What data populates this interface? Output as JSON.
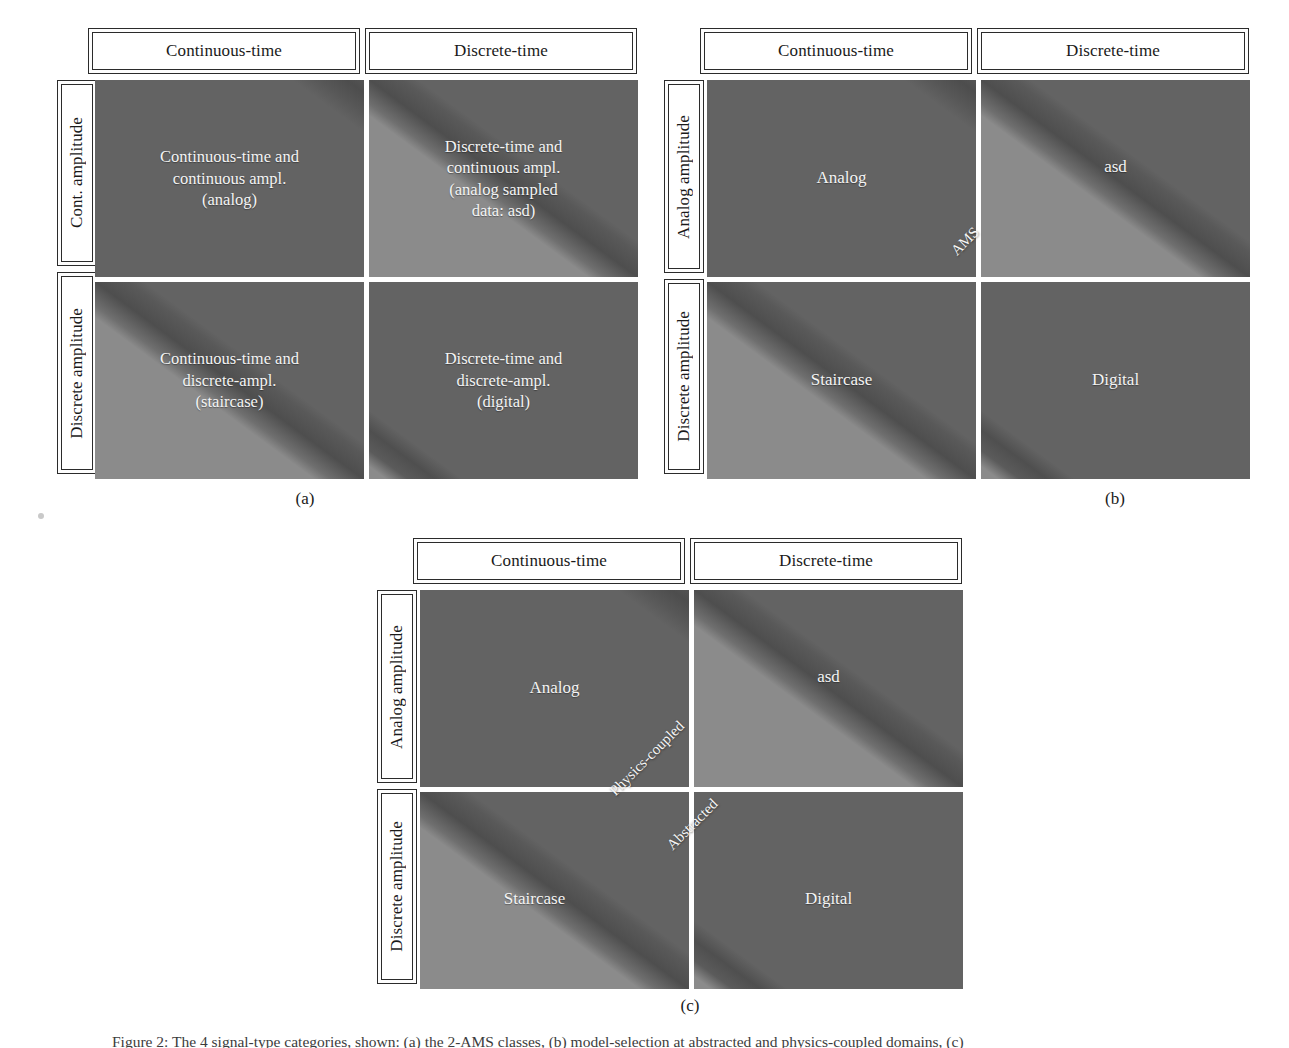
{
  "figure": {
    "caption": "Figure 2: The 4 signal-type categories, shown: (a) the 2-AMS classes, (b) model-selection at abstracted and physics-coupled domains, (c)"
  },
  "columns": {
    "continuous_time": "Continuous-time",
    "discrete_time": "Discrete-time"
  },
  "panels": [
    {
      "id": "a",
      "letter": "(a)",
      "col_headers": [
        "Continuous-time",
        "Discrete-time"
      ],
      "row_headers": [
        "Cont. amplitude",
        "Discrete amplitude"
      ],
      "cells": [
        {
          "pos": "top-left",
          "lines": [
            "Continuous-time and",
            "continuous ampl.",
            "(analog)"
          ],
          "shading": "dark"
        },
        {
          "pos": "top-right",
          "lines": [
            "Discrete-time and",
            "continuous ampl.",
            "(analog sampled",
            "data: asd)"
          ],
          "shading": "diagonal"
        },
        {
          "pos": "bottom-left",
          "lines": [
            "Continuous-time and",
            "discrete-ampl.",
            "(staircase)"
          ],
          "shading": "diagonal"
        },
        {
          "pos": "bottom-right",
          "lines": [
            "Discrete-time and",
            "discrete-ampl.",
            "(digital)"
          ],
          "shading": "light"
        }
      ],
      "diagonal_labels": []
    },
    {
      "id": "b",
      "letter": "(b)",
      "col_headers": [
        "Continuous-time",
        "Discrete-time"
      ],
      "row_headers": [
        "Analog amplitude",
        "Discrete amplitude"
      ],
      "cells": [
        {
          "pos": "top-left",
          "lines": [
            "Analog"
          ],
          "shading": "dark"
        },
        {
          "pos": "top-right",
          "lines": [
            "asd"
          ],
          "shading": "diagonal"
        },
        {
          "pos": "bottom-left",
          "lines": [
            "Staircase"
          ],
          "shading": "diagonal"
        },
        {
          "pos": "bottom-right",
          "lines": [
            "Digital"
          ],
          "shading": "light"
        }
      ],
      "diagonal_labels": [
        "AMS"
      ]
    },
    {
      "id": "c",
      "letter": "(c)",
      "col_headers": [
        "Continuous-time",
        "Discrete-time"
      ],
      "row_headers": [
        "Analog amplitude",
        "Discrete amplitude"
      ],
      "cells": [
        {
          "pos": "top-left",
          "lines": [
            "Analog"
          ],
          "shading": "dark"
        },
        {
          "pos": "top-right",
          "lines": [
            "asd"
          ],
          "shading": "diagonal"
        },
        {
          "pos": "bottom-left",
          "lines": [
            "Staircase"
          ],
          "shading": "diagonal"
        },
        {
          "pos": "bottom-right",
          "lines": [
            "Digital"
          ],
          "shading": "light"
        }
      ],
      "diagonal_labels": [
        "Physics-coupled",
        "Abstracted"
      ]
    }
  ],
  "colors": {
    "dark_fill": "#636363",
    "light_fill": "#8b8b8b",
    "band_shadow": "#4e4e4e",
    "border": "#2b2b2b",
    "label_text": "#f4f4f4",
    "page_background": "#ffffff"
  }
}
